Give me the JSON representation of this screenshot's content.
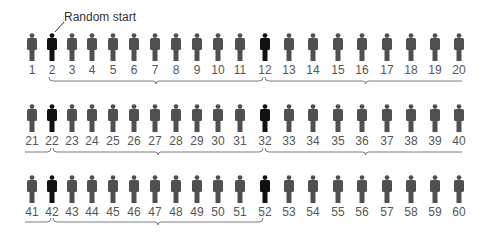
{
  "annotation": {
    "label": "Random start",
    "points_to": 2
  },
  "colors": {
    "normal_figure": "#505050",
    "selected_figure": "#111111",
    "number_text": "#555555",
    "bracket": "#7a7a7a"
  },
  "population_size": 60,
  "sampling_interval": 10,
  "random_start": 2,
  "selected_members": [
    2,
    12,
    22,
    32,
    42,
    52
  ],
  "rows": [
    {
      "numbers": [
        1,
        2,
        3,
        4,
        5,
        6,
        7,
        8,
        9,
        10,
        11,
        12,
        13,
        14,
        15,
        16,
        17,
        18,
        19,
        20
      ]
    },
    {
      "numbers": [
        21,
        22,
        23,
        24,
        25,
        26,
        27,
        28,
        29,
        30,
        31,
        32,
        33,
        34,
        35,
        36,
        37,
        38,
        39,
        40
      ]
    },
    {
      "numbers": [
        41,
        42,
        43,
        44,
        45,
        46,
        47,
        48,
        49,
        50,
        51,
        52,
        53,
        54,
        55,
        56,
        57,
        58,
        59,
        60
      ]
    }
  ],
  "brackets": [
    {
      "row": 0,
      "from": 2,
      "to": 12
    },
    {
      "row": 0,
      "from": 12,
      "to": 22
    },
    {
      "row": 1,
      "from": 12,
      "to": 22,
      "continuation_start": 21
    },
    {
      "row": 1,
      "from": 22,
      "to": 32
    },
    {
      "row": 1,
      "from": 32,
      "to": 42
    },
    {
      "row": 2,
      "from": 32,
      "to": 42,
      "continuation_start": 41
    },
    {
      "row": 2,
      "from": 42,
      "to": 52
    }
  ]
}
